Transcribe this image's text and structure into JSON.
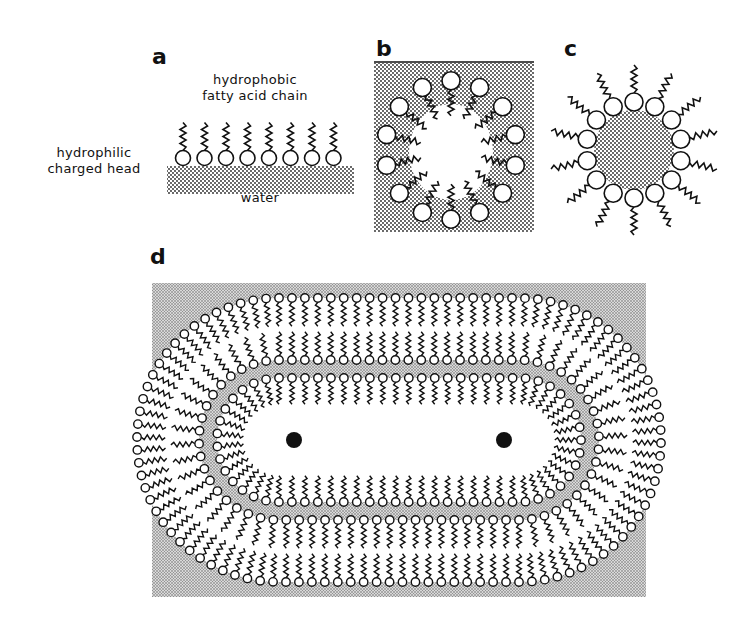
{
  "figure": {
    "panels": [
      {
        "id": "a",
        "letter": "a",
        "description": "monolayer at water surface"
      },
      {
        "id": "b",
        "letter": "b",
        "description": "reverse micelle in aqueous medium"
      },
      {
        "id": "c",
        "letter": "c",
        "description": "micelle"
      },
      {
        "id": "d",
        "letter": "d",
        "description": "multilamellar vesicle (liposome)"
      }
    ],
    "labels": {
      "hydrophobic_line1": "hydrophobic",
      "hydrophobic_line2": "fatty acid chain",
      "hydrophilic_line1": "hydrophilic",
      "hydrophilic_line2": "charged head",
      "water": "water"
    },
    "colors": {
      "ink": "#111111",
      "stipple": "#9a9a9a",
      "background": "#ffffff"
    }
  }
}
